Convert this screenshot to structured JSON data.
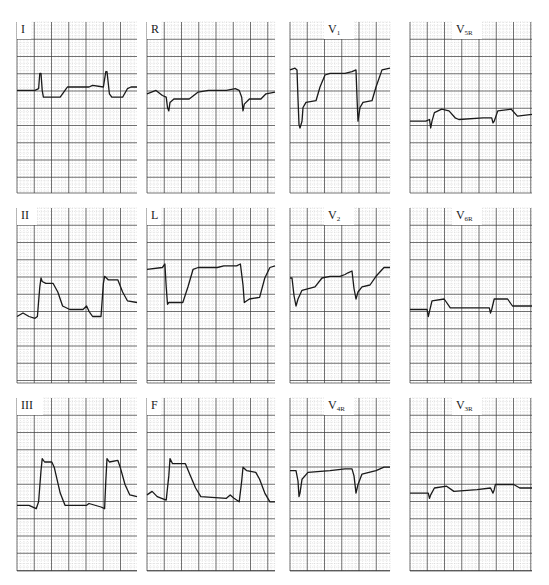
{
  "figure": {
    "type": "12-lead ECG panels (standard + right-sided leads)",
    "layout": {
      "rows": 3,
      "cols": 4
    }
  },
  "colors": {
    "background": "#ffffff",
    "grid_minor": "#b8b8b8",
    "grid_major": "#3a3a3a",
    "trace": "#1a1a1a",
    "label": "#222222"
  },
  "chart_data": {
    "type": "line",
    "title": "",
    "grid": true,
    "xlabel": "",
    "ylabel": "",
    "note": "Trace y values are in panel-relative units (0 = top, 1 = bottom); x in 0..1 across panel",
    "panels": [
      {
        "lead": "I",
        "label_main": "I",
        "label_sub": "",
        "box": [
          17,
          22,
          120,
          171
        ],
        "points": [
          [
            0,
            0.4
          ],
          [
            0.15,
            0.4
          ],
          [
            0.18,
            0.39
          ],
          [
            0.19,
            0.3
          ],
          [
            0.2,
            0.3
          ],
          [
            0.21,
            0.4
          ],
          [
            0.22,
            0.44
          ],
          [
            0.36,
            0.44
          ],
          [
            0.4,
            0.4
          ],
          [
            0.42,
            0.38
          ],
          [
            0.6,
            0.38
          ],
          [
            0.63,
            0.37
          ],
          [
            0.72,
            0.38
          ],
          [
            0.74,
            0.29
          ],
          [
            0.75,
            0.29
          ],
          [
            0.77,
            0.42
          ],
          [
            0.79,
            0.44
          ],
          [
            0.88,
            0.44
          ],
          [
            0.92,
            0.39
          ],
          [
            0.95,
            0.38
          ],
          [
            1,
            0.38
          ]
        ]
      },
      {
        "lead": "R",
        "label_main": "R",
        "label_sub": "",
        "box": [
          147,
          22,
          128,
          171
        ],
        "points": [
          [
            0,
            0.42
          ],
          [
            0.07,
            0.4
          ],
          [
            0.12,
            0.43
          ],
          [
            0.15,
            0.44
          ],
          [
            0.16,
            0.5
          ],
          [
            0.17,
            0.52
          ],
          [
            0.18,
            0.47
          ],
          [
            0.21,
            0.45
          ],
          [
            0.33,
            0.45
          ],
          [
            0.4,
            0.41
          ],
          [
            0.48,
            0.4
          ],
          [
            0.62,
            0.4
          ],
          [
            0.69,
            0.39
          ],
          [
            0.72,
            0.4
          ],
          [
            0.74,
            0.44
          ],
          [
            0.75,
            0.52
          ],
          [
            0.76,
            0.48
          ],
          [
            0.8,
            0.45
          ],
          [
            0.89,
            0.45
          ],
          [
            0.93,
            0.42
          ],
          [
            1,
            0.41
          ]
        ]
      },
      {
        "lead": "V1",
        "label_main": "V",
        "label_sub": "1",
        "box": [
          290,
          22,
          100,
          171
        ],
        "points": [
          [
            0,
            0.28
          ],
          [
            0.05,
            0.27
          ],
          [
            0.07,
            0.28
          ],
          [
            0.08,
            0.45
          ],
          [
            0.09,
            0.6
          ],
          [
            0.1,
            0.62
          ],
          [
            0.12,
            0.58
          ],
          [
            0.13,
            0.5
          ],
          [
            0.16,
            0.47
          ],
          [
            0.26,
            0.46
          ],
          [
            0.3,
            0.38
          ],
          [
            0.35,
            0.31
          ],
          [
            0.4,
            0.3
          ],
          [
            0.55,
            0.3
          ],
          [
            0.62,
            0.29
          ],
          [
            0.66,
            0.28
          ],
          [
            0.67,
            0.44
          ],
          [
            0.68,
            0.58
          ],
          [
            0.7,
            0.5
          ],
          [
            0.73,
            0.47
          ],
          [
            0.82,
            0.46
          ],
          [
            0.86,
            0.38
          ],
          [
            0.92,
            0.28
          ],
          [
            1,
            0.27
          ]
        ]
      },
      {
        "lead": "V5R",
        "label_main": "V",
        "label_sub": "5R",
        "box": [
          410,
          22,
          122,
          171
        ],
        "points": [
          [
            0,
            0.58
          ],
          [
            0.13,
            0.58
          ],
          [
            0.16,
            0.57
          ],
          [
            0.17,
            0.62
          ],
          [
            0.18,
            0.58
          ],
          [
            0.2,
            0.53
          ],
          [
            0.26,
            0.51
          ],
          [
            0.32,
            0.52
          ],
          [
            0.37,
            0.56
          ],
          [
            0.4,
            0.57
          ],
          [
            0.6,
            0.56
          ],
          [
            0.67,
            0.56
          ],
          [
            0.68,
            0.59
          ],
          [
            0.69,
            0.58
          ],
          [
            0.72,
            0.52
          ],
          [
            0.83,
            0.51
          ],
          [
            0.88,
            0.55
          ],
          [
            1,
            0.54
          ]
        ]
      },
      {
        "lead": "II",
        "label_main": "II",
        "label_sub": "",
        "box": [
          17,
          208,
          120,
          175
        ],
        "points": [
          [
            0,
            0.62
          ],
          [
            0.05,
            0.6
          ],
          [
            0.1,
            0.62
          ],
          [
            0.15,
            0.63
          ],
          [
            0.17,
            0.62
          ],
          [
            0.19,
            0.45
          ],
          [
            0.2,
            0.4
          ],
          [
            0.21,
            0.42
          ],
          [
            0.24,
            0.43
          ],
          [
            0.3,
            0.43
          ],
          [
            0.34,
            0.48
          ],
          [
            0.38,
            0.56
          ],
          [
            0.44,
            0.58
          ],
          [
            0.55,
            0.58
          ],
          [
            0.58,
            0.56
          ],
          [
            0.6,
            0.59
          ],
          [
            0.63,
            0.62
          ],
          [
            0.7,
            0.62
          ],
          [
            0.72,
            0.43
          ],
          [
            0.73,
            0.39
          ],
          [
            0.76,
            0.41
          ],
          [
            0.84,
            0.41
          ],
          [
            0.88,
            0.48
          ],
          [
            0.92,
            0.53
          ],
          [
            1,
            0.54
          ]
        ]
      },
      {
        "lead": "L",
        "label_main": "L",
        "label_sub": "",
        "box": [
          147,
          208,
          128,
          175
        ],
        "points": [
          [
            0,
            0.35
          ],
          [
            0.12,
            0.34
          ],
          [
            0.14,
            0.32
          ],
          [
            0.15,
            0.45
          ],
          [
            0.16,
            0.55
          ],
          [
            0.17,
            0.54
          ],
          [
            0.28,
            0.54
          ],
          [
            0.32,
            0.45
          ],
          [
            0.36,
            0.35
          ],
          [
            0.4,
            0.34
          ],
          [
            0.55,
            0.34
          ],
          [
            0.6,
            0.33
          ],
          [
            0.7,
            0.33
          ],
          [
            0.73,
            0.32
          ],
          [
            0.75,
            0.44
          ],
          [
            0.76,
            0.54
          ],
          [
            0.8,
            0.52
          ],
          [
            0.88,
            0.51
          ],
          [
            0.92,
            0.4
          ],
          [
            0.96,
            0.34
          ],
          [
            1,
            0.33
          ]
        ]
      },
      {
        "lead": "V2",
        "label_main": "V",
        "label_sub": "2",
        "box": [
          290,
          208,
          100,
          175
        ],
        "points": [
          [
            0,
            0.4
          ],
          [
            0.02,
            0.4
          ],
          [
            0.04,
            0.5
          ],
          [
            0.06,
            0.56
          ],
          [
            0.08,
            0.52
          ],
          [
            0.12,
            0.47
          ],
          [
            0.25,
            0.45
          ],
          [
            0.32,
            0.4
          ],
          [
            0.4,
            0.39
          ],
          [
            0.5,
            0.39
          ],
          [
            0.55,
            0.38
          ],
          [
            0.58,
            0.37
          ],
          [
            0.62,
            0.36
          ],
          [
            0.64,
            0.46
          ],
          [
            0.66,
            0.52
          ],
          [
            0.68,
            0.48
          ],
          [
            0.72,
            0.45
          ],
          [
            0.8,
            0.44
          ],
          [
            0.86,
            0.39
          ],
          [
            0.94,
            0.34
          ],
          [
            1,
            0.34
          ]
        ]
      },
      {
        "lead": "V6R",
        "label_main": "V",
        "label_sub": "6R",
        "box": [
          410,
          208,
          122,
          175
        ],
        "points": [
          [
            0,
            0.58
          ],
          [
            0.14,
            0.58
          ],
          [
            0.15,
            0.62
          ],
          [
            0.16,
            0.59
          ],
          [
            0.18,
            0.53
          ],
          [
            0.28,
            0.52
          ],
          [
            0.33,
            0.57
          ],
          [
            0.37,
            0.57
          ],
          [
            0.62,
            0.57
          ],
          [
            0.65,
            0.57
          ],
          [
            0.66,
            0.6
          ],
          [
            0.67,
            0.58
          ],
          [
            0.69,
            0.52
          ],
          [
            0.8,
            0.52
          ],
          [
            0.84,
            0.56
          ],
          [
            1,
            0.56
          ]
        ]
      },
      {
        "lead": "III",
        "label_main": "III",
        "label_sub": "",
        "box": [
          17,
          398,
          120,
          173
        ],
        "points": [
          [
            0,
            0.62
          ],
          [
            0.1,
            0.62
          ],
          [
            0.16,
            0.64
          ],
          [
            0.18,
            0.6
          ],
          [
            0.2,
            0.42
          ],
          [
            0.21,
            0.35
          ],
          [
            0.23,
            0.37
          ],
          [
            0.29,
            0.37
          ],
          [
            0.31,
            0.4
          ],
          [
            0.36,
            0.55
          ],
          [
            0.4,
            0.62
          ],
          [
            0.58,
            0.62
          ],
          [
            0.6,
            0.61
          ],
          [
            0.7,
            0.63
          ],
          [
            0.73,
            0.64
          ],
          [
            0.74,
            0.48
          ],
          [
            0.75,
            0.35
          ],
          [
            0.77,
            0.37
          ],
          [
            0.84,
            0.36
          ],
          [
            0.86,
            0.4
          ],
          [
            0.9,
            0.5
          ],
          [
            0.94,
            0.56
          ],
          [
            1,
            0.57
          ]
        ]
      },
      {
        "lead": "F",
        "label_main": "F",
        "label_sub": "",
        "box": [
          147,
          398,
          128,
          173
        ],
        "points": [
          [
            0,
            0.56
          ],
          [
            0.04,
            0.54
          ],
          [
            0.08,
            0.57
          ],
          [
            0.15,
            0.59
          ],
          [
            0.17,
            0.45
          ],
          [
            0.18,
            0.35
          ],
          [
            0.2,
            0.38
          ],
          [
            0.3,
            0.38
          ],
          [
            0.34,
            0.45
          ],
          [
            0.38,
            0.52
          ],
          [
            0.42,
            0.57
          ],
          [
            0.62,
            0.58
          ],
          [
            0.65,
            0.56
          ],
          [
            0.68,
            0.58
          ],
          [
            0.72,
            0.6
          ],
          [
            0.74,
            0.48
          ],
          [
            0.75,
            0.4
          ],
          [
            0.78,
            0.42
          ],
          [
            0.85,
            0.43
          ],
          [
            0.88,
            0.47
          ],
          [
            0.92,
            0.55
          ],
          [
            0.96,
            0.6
          ],
          [
            1,
            0.6
          ]
        ]
      },
      {
        "lead": "V4R",
        "label_main": "V",
        "label_sub": "4R",
        "box": [
          290,
          398,
          100,
          173
        ],
        "points": [
          [
            0,
            0.42
          ],
          [
            0.06,
            0.42
          ],
          [
            0.08,
            0.48
          ],
          [
            0.09,
            0.57
          ],
          [
            0.1,
            0.55
          ],
          [
            0.12,
            0.47
          ],
          [
            0.18,
            0.43
          ],
          [
            0.4,
            0.42
          ],
          [
            0.55,
            0.41
          ],
          [
            0.62,
            0.41
          ],
          [
            0.64,
            0.45
          ],
          [
            0.66,
            0.55
          ],
          [
            0.68,
            0.5
          ],
          [
            0.72,
            0.44
          ],
          [
            0.86,
            0.42
          ],
          [
            0.94,
            0.4
          ],
          [
            1,
            0.4
          ]
        ]
      },
      {
        "lead": "V3R",
        "label_main": "V",
        "label_sub": "3R",
        "box": [
          410,
          398,
          122,
          173
        ],
        "points": [
          [
            0,
            0.55
          ],
          [
            0.15,
            0.55
          ],
          [
            0.16,
            0.58
          ],
          [
            0.17,
            0.56
          ],
          [
            0.2,
            0.52
          ],
          [
            0.3,
            0.51
          ],
          [
            0.36,
            0.54
          ],
          [
            0.55,
            0.53
          ],
          [
            0.66,
            0.52
          ],
          [
            0.68,
            0.55
          ],
          [
            0.69,
            0.53
          ],
          [
            0.7,
            0.5
          ],
          [
            0.85,
            0.5
          ],
          [
            0.9,
            0.52
          ],
          [
            1,
            0.52
          ]
        ]
      }
    ]
  }
}
